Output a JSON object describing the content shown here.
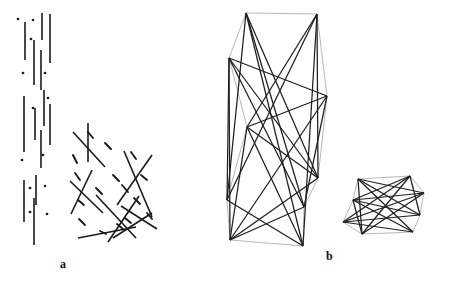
{
  "figure": {
    "width": 451,
    "height": 285,
    "background": "#ffffff",
    "type": "line-arrangement-and-polygon-diagram",
    "panels": [
      {
        "id": "a",
        "label": "a",
        "label_position": {
          "x": 60,
          "y": 258
        },
        "description": "Arrangement of line segments: a vertical cluster of near-parallel long segments interleaved with isolated dots, and a diagonal cluster of crossing long segments interleaved with short dashes."
      },
      {
        "id": "b",
        "label": "b",
        "label_position": {
          "x": 326,
          "y": 250
        },
        "description": "Two convex polygon outlines drawn in light gray with many dark interior chords connecting non-adjacent vertices."
      }
    ]
  },
  "styles": {
    "segment_color": "#1a1a1a",
    "dot_color": "#1a1a1a",
    "polygon_outline_color": "#9a9a9a",
    "polygon_chord_color": "#1f1f1f",
    "label_color": "#111111",
    "segment_width": 1.6,
    "dash_width": 1.9,
    "polygon_outline_width": 0.7,
    "polygon_chord_width": 1.25
  },
  "panel_a": {
    "vertical_segments": [
      {
        "x1": 25,
        "y1": 22,
        "x2": 25,
        "y2": 60
      },
      {
        "x1": 42,
        "y1": 13,
        "x2": 42,
        "y2": 40
      },
      {
        "x1": 50,
        "y1": 14,
        "x2": 50,
        "y2": 63
      },
      {
        "x1": 34,
        "y1": 40,
        "x2": 34,
        "y2": 85
      },
      {
        "x1": 41,
        "y1": 50,
        "x2": 41,
        "y2": 90
      },
      {
        "x1": 24,
        "y1": 96,
        "x2": 24,
        "y2": 152
      },
      {
        "x1": 35,
        "y1": 108,
        "x2": 35,
        "y2": 140
      },
      {
        "x1": 44,
        "y1": 90,
        "x2": 44,
        "y2": 126
      },
      {
        "x1": 41,
        "y1": 130,
        "x2": 41,
        "y2": 168
      },
      {
        "x1": 24,
        "y1": 180,
        "x2": 24,
        "y2": 222
      },
      {
        "x1": 36,
        "y1": 175,
        "x2": 36,
        "y2": 205
      },
      {
        "x1": 34,
        "y1": 198,
        "x2": 34,
        "y2": 245
      },
      {
        "x1": 50,
        "y1": 104,
        "x2": 50,
        "y2": 145
      }
    ],
    "dots": [
      {
        "x": 18,
        "y": 19
      },
      {
        "x": 33,
        "y": 20
      },
      {
        "x": 31,
        "y": 39
      },
      {
        "x": 23,
        "y": 73
      },
      {
        "x": 45,
        "y": 73
      },
      {
        "x": 33,
        "y": 108
      },
      {
        "x": 48,
        "y": 98
      },
      {
        "x": 43,
        "y": 155
      },
      {
        "x": 22,
        "y": 160
      },
      {
        "x": 30,
        "y": 188
      },
      {
        "x": 45,
        "y": 186
      },
      {
        "x": 30,
        "y": 212
      },
      {
        "x": 47,
        "y": 214
      }
    ],
    "diagonal_segments": [
      {
        "x1": 88,
        "y1": 123,
        "x2": 88,
        "y2": 162
      },
      {
        "x1": 73,
        "y1": 132,
        "x2": 105,
        "y2": 167
      },
      {
        "x1": 92,
        "y1": 170,
        "x2": 71,
        "y2": 214
      },
      {
        "x1": 70,
        "y1": 181,
        "x2": 103,
        "y2": 213
      },
      {
        "x1": 124,
        "y1": 151,
        "x2": 152,
        "y2": 217
      },
      {
        "x1": 152,
        "y1": 155,
        "x2": 117,
        "y2": 205
      },
      {
        "x1": 96,
        "y1": 195,
        "x2": 136,
        "y2": 238
      },
      {
        "x1": 139,
        "y1": 196,
        "x2": 108,
        "y2": 242
      },
      {
        "x1": 121,
        "y1": 206,
        "x2": 157,
        "y2": 229
      },
      {
        "x1": 78,
        "y1": 238,
        "x2": 136,
        "y2": 227
      },
      {
        "x1": 113,
        "y1": 238,
        "x2": 152,
        "y2": 213
      }
    ],
    "dashes": [
      {
        "x1": 73,
        "y1": 155,
        "x2": 77,
        "y2": 163
      },
      {
        "x1": 75,
        "y1": 173,
        "x2": 80,
        "y2": 180
      },
      {
        "x1": 105,
        "y1": 143,
        "x2": 111,
        "y2": 149
      },
      {
        "x1": 131,
        "y1": 152,
        "x2": 136,
        "y2": 159
      },
      {
        "x1": 113,
        "y1": 175,
        "x2": 119,
        "y2": 181
      },
      {
        "x1": 141,
        "y1": 175,
        "x2": 147,
        "y2": 180
      },
      {
        "x1": 96,
        "y1": 188,
        "x2": 102,
        "y2": 194
      },
      {
        "x1": 122,
        "y1": 185,
        "x2": 128,
        "y2": 192
      },
      {
        "x1": 134,
        "y1": 198,
        "x2": 140,
        "y2": 204
      },
      {
        "x1": 78,
        "y1": 200,
        "x2": 84,
        "y2": 205
      },
      {
        "x1": 79,
        "y1": 219,
        "x2": 85,
        "y2": 225
      },
      {
        "x1": 125,
        "y1": 218,
        "x2": 131,
        "y2": 223
      },
      {
        "x1": 147,
        "y1": 213,
        "x2": 152,
        "y2": 219
      },
      {
        "x1": 100,
        "y1": 231,
        "x2": 106,
        "y2": 234
      },
      {
        "x1": 117,
        "y1": 224,
        "x2": 123,
        "y2": 229
      },
      {
        "x1": 88,
        "y1": 132,
        "x2": 93,
        "y2": 138
      }
    ]
  },
  "panel_b": {
    "large_polygon": {
      "vertices": [
        {
          "x": 246,
          "y": 13
        },
        {
          "x": 317,
          "y": 14
        },
        {
          "x": 327,
          "y": 96
        },
        {
          "x": 318,
          "y": 178
        },
        {
          "x": 304,
          "y": 207
        },
        {
          "x": 303,
          "y": 246
        },
        {
          "x": 230,
          "y": 240
        },
        {
          "x": 227,
          "y": 200
        },
        {
          "x": 247,
          "y": 127
        },
        {
          "x": 229,
          "y": 58
        }
      ],
      "chords": [
        [
          0,
          3
        ],
        [
          0,
          5
        ],
        [
          0,
          7
        ],
        [
          1,
          3
        ],
        [
          1,
          5
        ],
        [
          1,
          8
        ],
        [
          2,
          4
        ],
        [
          2,
          6
        ],
        [
          2,
          8
        ],
        [
          3,
          6
        ],
        [
          3,
          8
        ],
        [
          3,
          9
        ],
        [
          4,
          6
        ],
        [
          4,
          9
        ],
        [
          5,
          7
        ],
        [
          5,
          8
        ],
        [
          6,
          8
        ],
        [
          6,
          9
        ],
        [
          7,
          9
        ],
        [
          0,
          4
        ],
        [
          1,
          7
        ],
        [
          2,
          9
        ]
      ]
    },
    "small_polygon": {
      "vertices": [
        {
          "x": 358,
          "y": 179
        },
        {
          "x": 410,
          "y": 176
        },
        {
          "x": 424,
          "y": 193
        },
        {
          "x": 420,
          "y": 215
        },
        {
          "x": 413,
          "y": 232
        },
        {
          "x": 362,
          "y": 234
        },
        {
          "x": 343,
          "y": 222
        },
        {
          "x": 353,
          "y": 200
        }
      ],
      "chords": [
        [
          0,
          2
        ],
        [
          0,
          3
        ],
        [
          0,
          4
        ],
        [
          0,
          5
        ],
        [
          1,
          3
        ],
        [
          1,
          5
        ],
        [
          1,
          6
        ],
        [
          1,
          7
        ],
        [
          2,
          5
        ],
        [
          2,
          6
        ],
        [
          2,
          7
        ],
        [
          3,
          6
        ],
        [
          3,
          7
        ],
        [
          4,
          6
        ],
        [
          4,
          7
        ],
        [
          5,
          7
        ]
      ]
    }
  }
}
